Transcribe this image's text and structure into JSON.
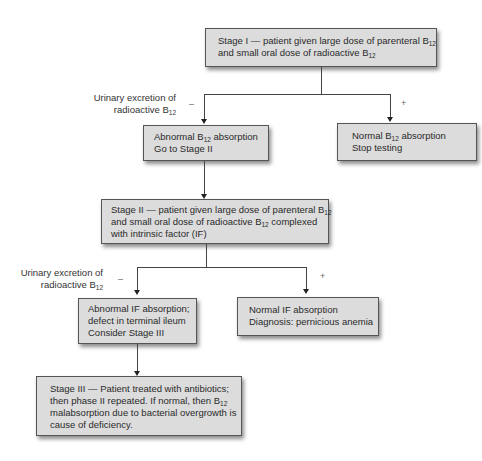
{
  "diagram": {
    "type": "flowchart",
    "stage1": {
      "line1_prefix": "Stage I — patient given large dose of parenteral B",
      "line1_sub": "12",
      "line2_prefix": "and small oral dose of radioactive B",
      "line2_sub": "12"
    },
    "branch_label_1": {
      "line1": "Urinary excretion of",
      "line2_prefix": "radioactive B",
      "line2_sub": "12",
      "negative": "–",
      "positive": "+"
    },
    "abnormal_b12": {
      "line1_prefix": "Abnormal B",
      "line1_sub": "12",
      "line1_suffix": " absorption",
      "line2": "Go to Stage II"
    },
    "normal_b12": {
      "line1_prefix": "Normal B",
      "line1_sub": "12",
      "line1_suffix": " absorption",
      "line2": "Stop testing"
    },
    "stage2": {
      "line1_prefix": "Stage II — patient given large dose of parenteral B",
      "line1_sub": "12",
      "line2_prefix": "and small oral dose of radioactive B",
      "line2_sub": "12",
      "line2_suffix": " complexed",
      "line3": "with intrinsic factor (IF)"
    },
    "branch_label_2": {
      "line1": "Urinary excretion of",
      "line2_prefix": "radioactive B",
      "line2_sub": "12",
      "negative": "–",
      "positive": "+"
    },
    "abnormal_if": {
      "line1": "Abnormal IF absorption;",
      "line2": "defect in terminal ileum",
      "line3": "Consider Stage III"
    },
    "normal_if": {
      "line1": "Normal IF absorption",
      "line2": "Diagnosis: pernicious anemia"
    },
    "stage3": {
      "line1": "Stage III — Patient treated with antibiotics;",
      "line2_prefix": "then phase II repeated. If normal, then B",
      "line2_sub": "12",
      "line3": "malabsorption due to bacterial overgrowth is",
      "line4": "cause of deficiency."
    },
    "colors": {
      "box_fill": "#dcdcdc",
      "box_border": "#555555",
      "line": "#444444",
      "text": "#2a2a2a"
    }
  }
}
